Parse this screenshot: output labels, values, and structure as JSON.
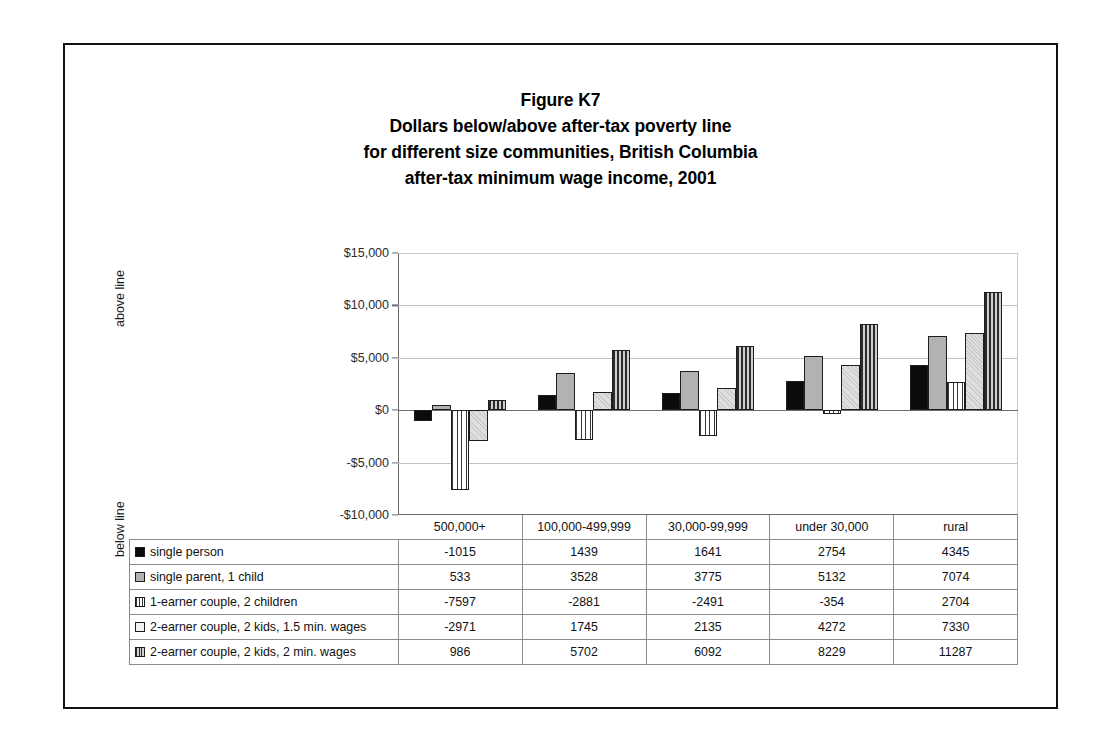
{
  "figure": {
    "title_lines": [
      "Figure K7",
      "Dollars below/above after-tax poverty line",
      "for different size communities, British Columbia",
      "after-tax minimum wage income, 2001"
    ],
    "above_line_label": "above line",
    "below_line_label": "below line"
  },
  "chart_data": {
    "type": "bar",
    "xlabel": "",
    "ylabel": "",
    "ylim": [
      -10000,
      15000
    ],
    "ytick_labels": [
      "$15,000",
      "$10,000",
      "$5,000",
      "$0",
      "-$5,000",
      "-$10,000"
    ],
    "ytick_values": [
      15000,
      10000,
      5000,
      0,
      -5000,
      -10000
    ],
    "grid": true,
    "legend_position": "table-below",
    "categories": [
      "500,000+",
      "100,000-499,999",
      "30,000-99,999",
      "under 30,000",
      "rural"
    ],
    "series": [
      {
        "name": "single person",
        "pattern": "solid-black",
        "values": [
          -1015,
          1439,
          1641,
          2754,
          4345
        ]
      },
      {
        "name": "single parent, 1 child",
        "pattern": "gray",
        "values": [
          533,
          3528,
          3775,
          5132,
          7074
        ]
      },
      {
        "name": "1-earner couple, 2 children",
        "pattern": "vstripe",
        "values": [
          -7597,
          -2881,
          -2491,
          -354,
          2704
        ]
      },
      {
        "name": "2-earner couple, 2 kids, 1.5 min. wages",
        "pattern": "light",
        "values": [
          -2971,
          1745,
          2135,
          4272,
          7330
        ]
      },
      {
        "name": "2-earner couple, 2 kids, 2 min. wages",
        "pattern": "dense-vstripe",
        "values": [
          986,
          5702,
          6092,
          8229,
          11287
        ]
      }
    ]
  },
  "colors": {
    "frame": "#111111",
    "gridline": "#c2c2c2",
    "axis": "#6a6a6a",
    "series_solid_black": "#0b0b0b",
    "series_gray": "#b2b2b2",
    "series_light": "#dedede"
  }
}
